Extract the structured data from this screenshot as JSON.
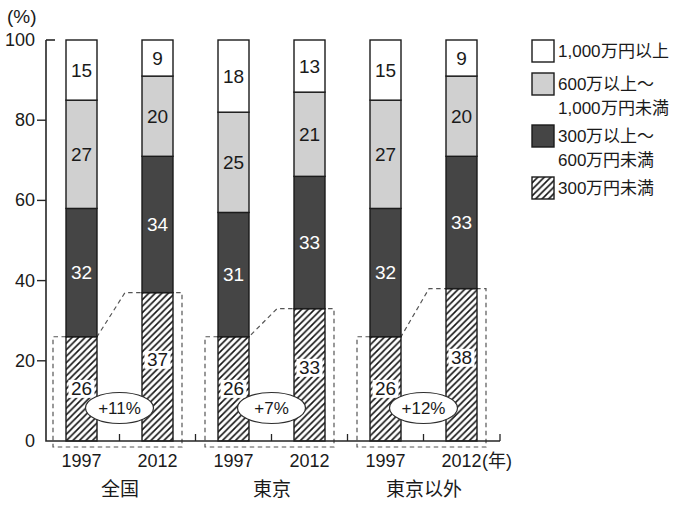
{
  "chart_data": {
    "type": "bar",
    "stacked": true,
    "grid": false,
    "legend_position": "top-right",
    "y_axis": {
      "unit_label": "(%)",
      "ticks": [
        0,
        20,
        40,
        60,
        80,
        100
      ],
      "range": [
        0,
        100
      ]
    },
    "x_axis": {
      "unit_label": "(年)"
    },
    "segments_bottom_to_top": [
      {
        "key": "under_300",
        "label": "300万円未満",
        "style": "hatch"
      },
      {
        "key": "300_to_600",
        "label": "300万以上～600万円未満",
        "style": "dark"
      },
      {
        "key": "600_to_1000",
        "label": "600万以上～1,000万円未満",
        "style": "light"
      },
      {
        "key": "over_1000",
        "label": "1,000万円以上",
        "style": "white"
      }
    ],
    "legend": [
      {
        "style": "white",
        "lines": [
          "1,000万円以上"
        ]
      },
      {
        "style": "light",
        "lines": [
          "600万以上～",
          "1,000万円未満"
        ]
      },
      {
        "style": "dark",
        "lines": [
          "300万以上～",
          "600万円未満"
        ]
      },
      {
        "style": "hatch",
        "lines": [
          "300万円未満"
        ]
      }
    ],
    "groups": [
      {
        "label": "全国",
        "annotation": "+11%",
        "bars": [
          {
            "year": "1997",
            "values": [
              26,
              32,
              27,
              15
            ]
          },
          {
            "year": "2012",
            "values": [
              37,
              34,
              20,
              9
            ]
          }
        ]
      },
      {
        "label": "東京",
        "annotation": "+7%",
        "bars": [
          {
            "year": "1997",
            "values": [
              26,
              31,
              25,
              18
            ]
          },
          {
            "year": "2012",
            "values": [
              33,
              33,
              21,
              13
            ]
          }
        ]
      },
      {
        "label": "東京以外",
        "annotation": "+12%",
        "bars": [
          {
            "year": "1997",
            "values": [
              26,
              32,
              27,
              15
            ]
          },
          {
            "year": "2012",
            "values": [
              38,
              33,
              20,
              9
            ]
          }
        ]
      }
    ],
    "colors": {
      "dark": "#454545",
      "light": "#d0d0d0",
      "white": "#ffffff",
      "stroke": "#1b1b1b",
      "text": "#1a1a1a",
      "dash": "#555555",
      "background": "#ffffff"
    }
  }
}
